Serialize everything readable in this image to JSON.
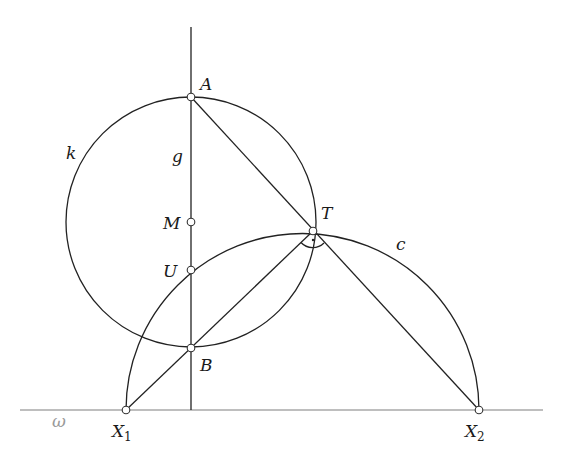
{
  "figure": {
    "lines": {
      "omega": {
        "label": "ω",
        "color": "#a8a8a8"
      },
      "g": {
        "label": "g"
      }
    },
    "circles": {
      "k": {
        "label": "k",
        "center": "M",
        "through": [
          "A",
          "B"
        ]
      },
      "c": {
        "label": "c",
        "endpoints": [
          "X1",
          "X2"
        ],
        "type": "semicircle"
      }
    },
    "points": [
      {
        "id": "A",
        "label": "A"
      },
      {
        "id": "M",
        "label": "M"
      },
      {
        "id": "U",
        "label": "U"
      },
      {
        "id": "B",
        "label": "B"
      },
      {
        "id": "T",
        "label": "T"
      },
      {
        "id": "X1",
        "label": "X",
        "sub": "1"
      },
      {
        "id": "X2",
        "label": "X",
        "sub": "2"
      }
    ],
    "segments": [
      {
        "from": "A",
        "to": "X2",
        "via": "T"
      },
      {
        "from": "X1",
        "to": "T",
        "via": "B"
      }
    ],
    "angle_marks": [
      {
        "at": "T",
        "type": "right-angle",
        "between": [
          "TX1",
          "TX2"
        ]
      }
    ]
  }
}
